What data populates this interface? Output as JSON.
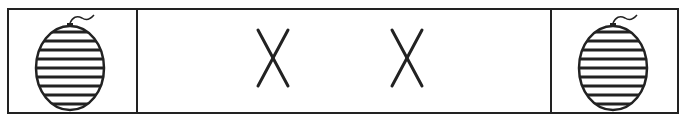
{
  "diagram": {
    "panels": [
      {
        "content": "watermelon-icon"
      },
      {
        "content": "x-marks",
        "marks": [
          "X",
          "X"
        ]
      },
      {
        "content": "watermelon-icon"
      }
    ],
    "colors": {
      "stroke": "#222222",
      "background": "#ffffff"
    }
  }
}
